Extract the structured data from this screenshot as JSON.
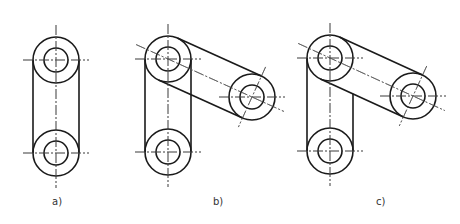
{
  "figures": [
    {
      "id": "a",
      "label": "a)",
      "label_pos": [
        52,
        196
      ],
      "circles": [
        {
          "name": "top-joint",
          "cx": 56,
          "cy": 60
        },
        {
          "name": "bottom-joint",
          "cx": 56,
          "cy": 153
        }
      ],
      "links": [
        {
          "from": 0,
          "to": 1,
          "type": "vertical-full"
        }
      ]
    },
    {
      "id": "b",
      "label": "b)",
      "label_pos": [
        213,
        196
      ],
      "circles": [
        {
          "name": "top-joint",
          "cx": 168,
          "cy": 59
        },
        {
          "name": "right-joint",
          "cx": 252,
          "cy": 97
        },
        {
          "name": "bottom-joint",
          "cx": 168,
          "cy": 152
        }
      ],
      "links": [
        {
          "from": 0,
          "to": 2,
          "type": "vertical-full"
        },
        {
          "from": 0,
          "to": 1,
          "type": "diagonal"
        }
      ]
    },
    {
      "id": "c",
      "label": "c)",
      "label_pos": [
        376,
        196
      ],
      "circles": [
        {
          "name": "top-joint",
          "cx": 330,
          "cy": 58
        },
        {
          "name": "right-joint",
          "cx": 413,
          "cy": 96
        },
        {
          "name": "bottom-joint",
          "cx": 330,
          "cy": 151
        }
      ],
      "links": [
        {
          "from": 0,
          "to": 2,
          "type": "vertical-partial-hidden"
        },
        {
          "from": 0,
          "to": 1,
          "type": "diagonal"
        }
      ]
    }
  ],
  "geometry": {
    "outer_radius": 23,
    "inner_radius": 12,
    "centerline_extension": 10
  },
  "colors": {
    "line": "#1a1a1a",
    "centerline": "#555555",
    "background": "#ffffff"
  }
}
